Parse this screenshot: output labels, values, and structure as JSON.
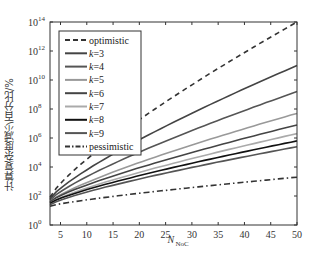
{
  "chart_data": {
    "type": "line",
    "title": "",
    "xlabel": "N_NoC",
    "xlabel_main": "N",
    "xlabel_sub": "NoC",
    "ylabel": "计算复杂度减少百分比/%",
    "yscale": "log",
    "xlim": [
      3,
      50
    ],
    "ylim": [
      1,
      100000000000000.0
    ],
    "x_ticks": [
      5,
      10,
      15,
      20,
      25,
      30,
      35,
      40,
      45,
      50
    ],
    "y_ticks": [
      "10^0",
      "10^2",
      "10^4",
      "10^6",
      "10^8",
      "10^10",
      "10^12",
      "10^14"
    ],
    "legend_position": "upper-left",
    "grid": false,
    "series": [
      {
        "name": "optimistic",
        "style": "dashed",
        "color": "#333333",
        "x": [
          3,
          50
        ],
        "log10_y": [
          1.9,
          14.0
        ]
      },
      {
        "name": "k=3",
        "style": "solid",
        "color": "#444444",
        "x": [
          3,
          50
        ],
        "log10_y": [
          1.8,
          11.0
        ]
      },
      {
        "name": "k=4",
        "style": "solid",
        "color": "#555555",
        "x": [
          3,
          50
        ],
        "log10_y": [
          1.7,
          9.2
        ]
      },
      {
        "name": "k=5",
        "style": "solid",
        "color": "#999999",
        "x": [
          3,
          50
        ],
        "log10_y": [
          1.6,
          7.7
        ]
      },
      {
        "name": "k=6",
        "style": "solid",
        "color": "#444444",
        "x": [
          3,
          50
        ],
        "log10_y": [
          1.6,
          6.9
        ]
      },
      {
        "name": "k=7",
        "style": "solid",
        "color": "#aaaaaa",
        "x": [
          3,
          50
        ],
        "log10_y": [
          1.5,
          6.3
        ]
      },
      {
        "name": "k=8",
        "style": "solid",
        "color": "#111111",
        "x": [
          3,
          50
        ],
        "log10_y": [
          1.5,
          5.8
        ]
      },
      {
        "name": "k=9",
        "style": "solid",
        "color": "#555555",
        "x": [
          3,
          50
        ],
        "log10_y": [
          1.4,
          5.4
        ]
      },
      {
        "name": "pessimistic",
        "style": "dashdot",
        "color": "#333333",
        "x": [
          3,
          50
        ],
        "log10_y": [
          1.3,
          3.3
        ]
      }
    ]
  },
  "legend": {
    "items": [
      "optimistic",
      "k=3",
      "k=4",
      "k=5",
      "k=6",
      "k=7",
      "k=8",
      "k=9",
      "pessimistic"
    ]
  },
  "axes": {
    "x_tick_labels": [
      "5",
      "10",
      "15",
      "20",
      "25",
      "30",
      "35",
      "40",
      "45",
      "50"
    ],
    "y_tick_base": "10",
    "y_tick_exps": [
      "0",
      "2",
      "4",
      "6",
      "8",
      "10",
      "12",
      "14"
    ],
    "xlabel_main": "N",
    "xlabel_sub": "NoC",
    "ylabel": "计算复杂度减少百分比/%"
  }
}
